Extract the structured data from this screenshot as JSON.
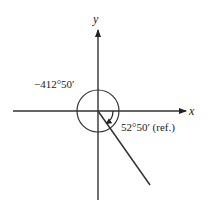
{
  "diagram": {
    "type": "angle-in-standard-position",
    "axes": {
      "x_label": "x",
      "y_label": "y"
    },
    "angle": {
      "label": "−412°50′",
      "direction": "clockwise",
      "revolutions_shown": "full circle plus partial"
    },
    "reference_angle": {
      "label": "52°50′ (ref.)"
    },
    "colors": {
      "line": "#333333",
      "text": "#222222",
      "background": "#ffffff"
    }
  }
}
